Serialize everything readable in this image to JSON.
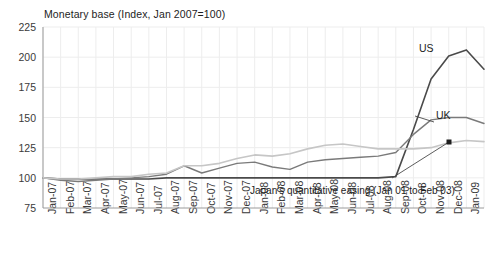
{
  "chart_data": {
    "type": "line",
    "title": "Monetary base (Index, Jan 2007=100)",
    "xlabel": "",
    "ylabel": "",
    "ylim": [
      75,
      225
    ],
    "yticks": [
      75,
      100,
      125,
      150,
      175,
      200,
      225
    ],
    "grid": true,
    "legend_position": "inline-annotations",
    "categories": [
      "Jan-07",
      "Feb-07",
      "Mar-07",
      "Apr-07",
      "May-07",
      "Jun-07",
      "Jul-07",
      "Aug-07",
      "Sep-07",
      "Oct-07",
      "Nov-07",
      "Dec-07",
      "Jan-08",
      "Feb-08",
      "Mar-08",
      "Apr-08",
      "May-08",
      "Jun-08",
      "Jul-08",
      "Aug-08",
      "Sep-08",
      "Oct-08",
      "Nov-08",
      "Dec-08",
      "Jan-09",
      "Feb-09"
    ],
    "series": [
      {
        "name": "US",
        "color": "#4a4a4a",
        "width": 1.6,
        "values": [
          100,
          99,
          99,
          99,
          99,
          99,
          99,
          100,
          100,
          100,
          100,
          100,
          100,
          100,
          100,
          100,
          100,
          100,
          100,
          100,
          101,
          140,
          182,
          201,
          206,
          190
        ]
      },
      {
        "name": "UK",
        "color": "#7a7a7a",
        "width": 1.4,
        "values": [
          100,
          98,
          97,
          98,
          99,
          100,
          101,
          103,
          110,
          104,
          108,
          112,
          113,
          109,
          107,
          113,
          115,
          116,
          117,
          118,
          121,
          136,
          148,
          150,
          150,
          145
        ]
      },
      {
        "name": "Japan",
        "color": "#c6c6c6",
        "width": 1.6,
        "values": [
          100,
          99,
          99,
          100,
          101,
          101,
          103,
          104,
          110,
          110,
          112,
          116,
          119,
          118,
          120,
          124,
          127,
          128,
          126,
          124,
          124,
          124,
          125,
          129,
          131,
          130
        ]
      }
    ],
    "annotations": [
      {
        "name": "US",
        "text": "US",
        "x_px": 419,
        "y_px": 43
      },
      {
        "name": "UK",
        "text": "UK",
        "x_px": 436,
        "y_px": 110
      },
      {
        "name": "japan-qe",
        "text": "Japan's quantitative easing (Jan 01 to Feb 03)",
        "x_px": 250,
        "y_px": 186
      }
    ],
    "leader_lines": [
      {
        "name": "uk-leader",
        "x1": 434,
        "y1": 122,
        "x2": 415,
        "y2": 116
      },
      {
        "name": "japan-qe-arrow",
        "x1": 392,
        "y1": 178,
        "x2": 449,
        "y2": 142
      }
    ]
  },
  "axes": {
    "y_tick_labels": [
      "225",
      "200",
      "175",
      "150",
      "125",
      "100",
      "75"
    ],
    "x_tick_labels": [
      "Jan-07",
      "Feb-07",
      "Mar-07",
      "Apr-07",
      "May-07",
      "Jun-07",
      "Jul-07",
      "Aug-07",
      "Sep-07",
      "Oct-07",
      "Nov-07",
      "Dec-07",
      "Jan-08",
      "Feb-08",
      "Mar-08",
      "Apr-08",
      "May-08",
      "Jun-08",
      "Jul-08",
      "Aug-08",
      "Sep-08",
      "Oct-08",
      "Nov-08",
      "Dec-08",
      "Jan-09",
      "Feb-09"
    ]
  },
  "colors": {
    "us_line": "#4a4a4a",
    "uk_line": "#7a7a7a",
    "japan_line": "#c6c6c6",
    "axis": "#9a9a9a",
    "grid": "#ededed",
    "text": "#2b2b2b",
    "background": "#ffffff"
  }
}
